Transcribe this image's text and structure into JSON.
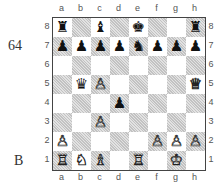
{
  "diagram": {
    "number": "64",
    "side_to_move": "B",
    "files": [
      "a",
      "b",
      "c",
      "d",
      "e",
      "f",
      "g",
      "h"
    ],
    "ranks": [
      "8",
      "7",
      "6",
      "5",
      "4",
      "3",
      "2",
      "1"
    ],
    "position": [
      [
        "bR",
        "",
        "bB",
        "",
        "bK",
        "",
        "",
        "bR"
      ],
      [
        "bP",
        "bP",
        "bP",
        "bP",
        "bN",
        "bP",
        "bP",
        "bP"
      ],
      [
        "",
        "",
        "",
        "",
        "",
        "",
        "",
        ""
      ],
      [
        "",
        "bQ",
        "wP",
        "",
        "",
        "",
        "",
        "wQ"
      ],
      [
        "",
        "",
        "",
        "bP",
        "",
        "",
        "",
        ""
      ],
      [
        "",
        "",
        "wP",
        "",
        "",
        "",
        "",
        ""
      ],
      [
        "wP",
        "",
        "",
        "",
        "",
        "wP",
        "wP",
        "wP"
      ],
      [
        "wR",
        "wN",
        "wB",
        "",
        "wR",
        "",
        "wK",
        ""
      ]
    ],
    "piece_glyphs": {
      "wK": "♔",
      "wQ": "♕",
      "wR": "♖",
      "wB": "♗",
      "wN": "♘",
      "wP": "♙",
      "bK": "♚",
      "bQ": "♛",
      "bR": "♜",
      "bB": "♝",
      "bN": "♞",
      "bP": "♟"
    },
    "colors": {
      "light_square": "#ffffff",
      "dark_square": "#d4d4d4",
      "border": "#444444"
    }
  }
}
